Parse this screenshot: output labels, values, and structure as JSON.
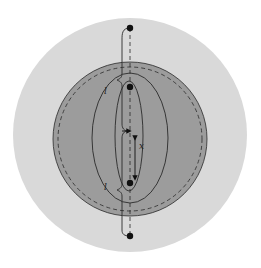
{
  "diagram": {
    "type": "nested-spheres-with-charges",
    "colors": {
      "background": "#ffffff",
      "outer_sphere": "#d9d9d9",
      "inner_sphere": "#9c9c9c",
      "stroke": "#2a2a2a",
      "dots": "#111111"
    },
    "labels": {
      "upper_brace": "l",
      "lower_brace": "l",
      "separation": "x"
    },
    "points": [
      {
        "name": "top-exterior-charge",
        "x": 130,
        "y": 28
      },
      {
        "name": "upper-interior-charge",
        "x": 130,
        "y": 87
      },
      {
        "name": "lower-interior-charge",
        "x": 130,
        "y": 183
      },
      {
        "name": "bottom-exterior-charge",
        "x": 130,
        "y": 236
      }
    ]
  }
}
